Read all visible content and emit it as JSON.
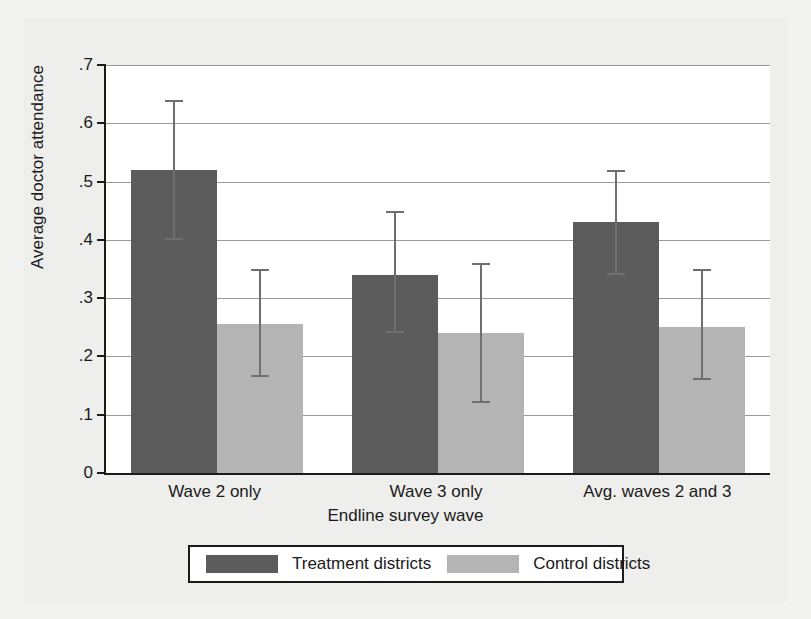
{
  "chart_data": {
    "type": "bar",
    "title": "",
    "xlabel": "Endline survey wave",
    "ylabel": "Average doctor attendance",
    "categories": [
      "Wave 2 only",
      "Wave 3 only",
      "Avg. waves 2 and 3"
    ],
    "ylim": [
      0,
      0.7
    ],
    "yticks": [
      "0",
      ".1",
      ".2",
      ".3",
      ".4",
      ".5",
      ".6",
      ".7"
    ],
    "ytick_values": [
      0,
      0.1,
      0.2,
      0.3,
      0.4,
      0.5,
      0.6,
      0.7
    ],
    "grid": true,
    "legend_position": "below-axis",
    "series": [
      {
        "name": "Treatment districts",
        "color": "#5c5c5c",
        "values": [
          0.52,
          0.34,
          0.43
        ],
        "ci_low": [
          0.4,
          0.24,
          0.34
        ],
        "ci_high": [
          0.64,
          0.45,
          0.52
        ]
      },
      {
        "name": "Control districts",
        "color": "#b4b4b4",
        "values": [
          0.255,
          0.24,
          0.25
        ],
        "ci_low": [
          0.165,
          0.12,
          0.16
        ],
        "ci_high": [
          0.35,
          0.36,
          0.35
        ]
      }
    ]
  },
  "legend": {
    "entries": [
      {
        "label": "Treatment districts"
      },
      {
        "label": "Control districts"
      }
    ]
  },
  "axes": {
    "ylabel": "Average doctor attendance",
    "xlabel": "Endline survey wave"
  }
}
